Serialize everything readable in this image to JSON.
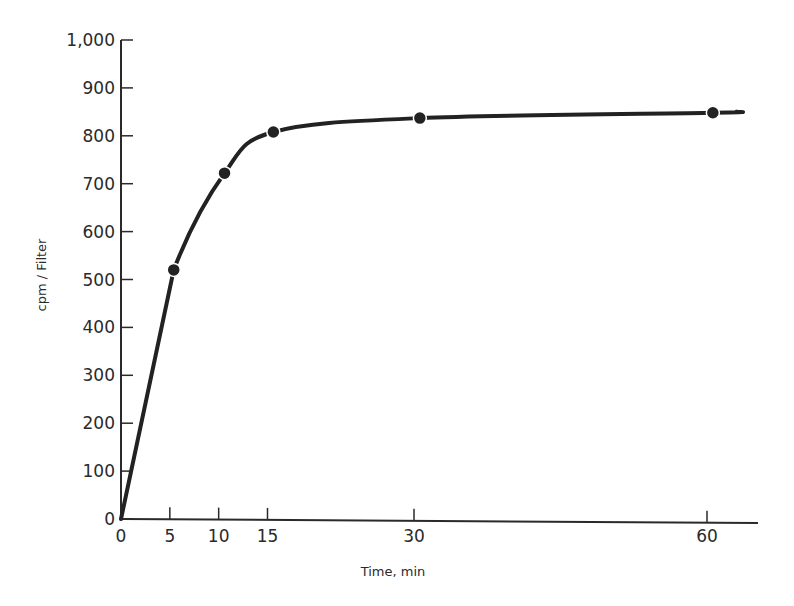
{
  "chart_data": {
    "type": "line",
    "title": "",
    "xlabel": "Time, min",
    "ylabel": "cpm / Filter",
    "xlim": [
      0,
      65
    ],
    "ylim": [
      0,
      1000
    ],
    "x_ticks": [
      0,
      5,
      10,
      15,
      30,
      60
    ],
    "x_tick_labels": [
      "0",
      "5",
      "10",
      "15",
      "30",
      "60"
    ],
    "y_ticks": [
      0,
      100,
      200,
      300,
      400,
      500,
      600,
      700,
      800,
      900,
      1000
    ],
    "y_tick_labels": [
      "0",
      "100",
      "200",
      "300",
      "400",
      "500",
      "600",
      "700",
      "800",
      "900",
      "1,000"
    ],
    "grid": false,
    "legend": null,
    "series": [
      {
        "name": "cpm/Filter",
        "x": [
          0,
          5.4,
          10.6,
          15.6,
          30.6,
          60.6
        ],
        "y": [
          0,
          520,
          722,
          808,
          837,
          848
        ],
        "markers": [
          false,
          true,
          true,
          true,
          true,
          true
        ],
        "line_extends_to_x": 63
      }
    ]
  }
}
